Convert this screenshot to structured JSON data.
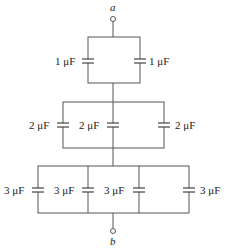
{
  "diagram": {
    "type": "capacitor-network",
    "terminals": {
      "top": {
        "label": "a"
      },
      "bottom": {
        "label": "b"
      }
    },
    "groups": [
      {
        "name": "top-parallel-group",
        "capacitors": [
          {
            "label": "1 μF",
            "value_uF": 1
          },
          {
            "label": "1 μF",
            "value_uF": 1
          }
        ]
      },
      {
        "name": "middle-parallel-group",
        "capacitors": [
          {
            "label": "2 μF",
            "value_uF": 2
          },
          {
            "label": "2 μF",
            "value_uF": 2
          },
          {
            "label": "2 μF",
            "value_uF": 2
          }
        ]
      },
      {
        "name": "bottom-parallel-group",
        "capacitors": [
          {
            "label": "3 μF",
            "value_uF": 3
          },
          {
            "label": "3 μF",
            "value_uF": 3
          },
          {
            "label": "3 μF",
            "value_uF": 3
          },
          {
            "label": "3 μF",
            "value_uF": 3
          }
        ]
      }
    ],
    "connection": "three parallel groups connected in series between a and b"
  }
}
